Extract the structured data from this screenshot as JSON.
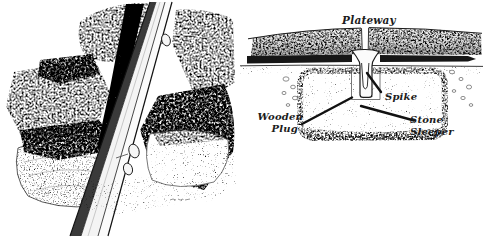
{
  "figure": {
    "colors": {
      "paper": "#ffffff",
      "ink": "#1c1c1c"
    }
  },
  "diagram": {
    "labels": {
      "plateway": "Plateway",
      "spike": "Spike",
      "wooden_plug_line1": "Wooden",
      "wooden_plug_line2": "Plug",
      "stone_sleeper_line1": "Stone",
      "stone_sleeper_line2": "Sleeper"
    }
  }
}
